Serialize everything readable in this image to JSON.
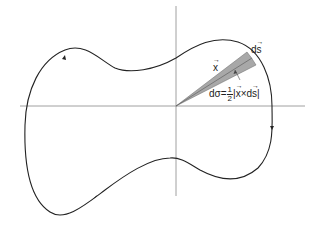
{
  "diagram": {
    "labels": {
      "x_vector": "x",
      "ds_vector_d": "d",
      "ds_vector_s": "s",
      "area_lhs": "dσ=",
      "frac_num": "1",
      "frac_den": "2",
      "area_rhs_open": "|",
      "area_rhs_x": "x",
      "area_rhs_times": "×",
      "area_rhs_d": "d",
      "area_rhs_s": "s",
      "area_rhs_close": "|"
    },
    "colors": {
      "curve": "#222222",
      "axes": "#888888",
      "wedge_fill": "#a8a8a8",
      "text": "#222222"
    }
  }
}
